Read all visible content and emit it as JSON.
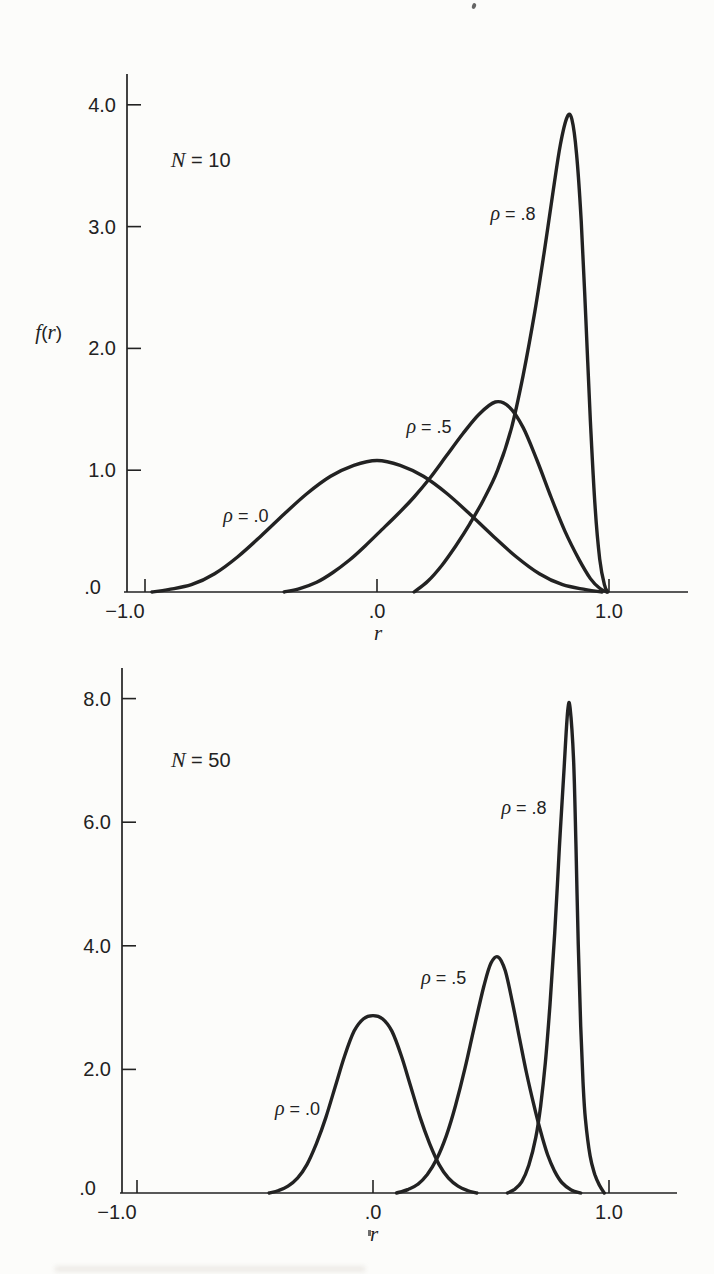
{
  "figure": {
    "background": "#fcfcfa",
    "ink": "#222222",
    "description_visible_text_only": true
  },
  "chart_data": [
    {
      "id": "n10",
      "type": "line",
      "title": "N = 10",
      "xlabel": "r",
      "ylabel": "f(r)",
      "xlim": [
        -1.09,
        1.34
      ],
      "ylim": [
        0,
        4.25
      ],
      "grid": false,
      "legend": "inline-curve-labels",
      "x_ticks": [
        {
          "value": -1.0,
          "label": "−1.0"
        },
        {
          "value": 0.0,
          "label": ".0"
        },
        {
          "value": 1.0,
          "label": "1.0"
        }
      ],
      "y_ticks": [
        {
          "value": 4.0,
          "label": "4.0"
        },
        {
          "value": 3.0,
          "label": "3.0"
        },
        {
          "value": 2.0,
          "label": "2.0"
        },
        {
          "value": 1.0,
          "label": "1.0"
        },
        {
          "value": 0.0,
          "label": ".0"
        }
      ],
      "annotations": [
        {
          "name": "sample-size-label",
          "text": "N = 10",
          "at": {
            "x": -0.76,
            "y": 3.55
          }
        }
      ],
      "series": [
        {
          "name": "rho-0.0",
          "rho": 0.0,
          "label": "ρ = .0",
          "label_at": {
            "x": -0.565,
            "y": 0.63
          },
          "points": [
            [
              -0.97,
              0
            ],
            [
              -0.9,
              0.02
            ],
            [
              -0.8,
              0.06
            ],
            [
              -0.7,
              0.15
            ],
            [
              -0.6,
              0.29
            ],
            [
              -0.5,
              0.46
            ],
            [
              -0.4,
              0.64
            ],
            [
              -0.3,
              0.81
            ],
            [
              -0.2,
              0.95
            ],
            [
              -0.1,
              1.04
            ],
            [
              0,
              1.08
            ],
            [
              0.1,
              1.04
            ],
            [
              0.2,
              0.95
            ],
            [
              0.3,
              0.81
            ],
            [
              0.4,
              0.64
            ],
            [
              0.5,
              0.46
            ],
            [
              0.6,
              0.29
            ],
            [
              0.7,
              0.15
            ],
            [
              0.8,
              0.06
            ],
            [
              0.9,
              0.02
            ],
            [
              0.97,
              0
            ]
          ]
        },
        {
          "name": "rho-0.5",
          "rho": 0.5,
          "label": "ρ = .5",
          "label_at": {
            "x": 0.224,
            "y": 1.36
          },
          "points": [
            [
              -0.4,
              0
            ],
            [
              -0.33,
              0.03
            ],
            [
              -0.26,
              0.08
            ],
            [
              -0.19,
              0.16
            ],
            [
              -0.12,
              0.26
            ],
            [
              -0.05,
              0.38
            ],
            [
              0.02,
              0.51
            ],
            [
              0.09,
              0.64
            ],
            [
              0.16,
              0.78
            ],
            [
              0.23,
              0.94
            ],
            [
              0.3,
              1.12
            ],
            [
              0.37,
              1.3
            ],
            [
              0.44,
              1.46
            ],
            [
              0.51,
              1.56
            ],
            [
              0.57,
              1.52
            ],
            [
              0.63,
              1.35
            ],
            [
              0.69,
              1.08
            ],
            [
              0.75,
              0.78
            ],
            [
              0.81,
              0.5
            ],
            [
              0.87,
              0.27
            ],
            [
              0.92,
              0.11
            ],
            [
              0.96,
              0.03
            ],
            [
              0.99,
              0
            ]
          ]
        },
        {
          "name": "rho-0.8",
          "rho": 0.8,
          "label": "ρ = .8",
          "label_at": {
            "x": 0.586,
            "y": 3.11
          },
          "points": [
            [
              0.16,
              0
            ],
            [
              0.22,
              0.09
            ],
            [
              0.28,
              0.22
            ],
            [
              0.34,
              0.38
            ],
            [
              0.4,
              0.56
            ],
            [
              0.46,
              0.76
            ],
            [
              0.52,
              1.0
            ],
            [
              0.58,
              1.35
            ],
            [
              0.63,
              1.78
            ],
            [
              0.68,
              2.3
            ],
            [
              0.72,
              2.78
            ],
            [
              0.76,
              3.3
            ],
            [
              0.79,
              3.67
            ],
            [
              0.82,
              3.9
            ],
            [
              0.84,
              3.88
            ],
            [
              0.86,
              3.6
            ],
            [
              0.88,
              3.05
            ],
            [
              0.9,
              2.25
            ],
            [
              0.92,
              1.4
            ],
            [
              0.94,
              0.7
            ],
            [
              0.96,
              0.27
            ],
            [
              0.98,
              0.06
            ],
            [
              0.995,
              0
            ]
          ]
        }
      ]
    },
    {
      "id": "n50",
      "type": "line",
      "title": "N = 50",
      "xlabel": "r",
      "ylabel": "",
      "xlim": [
        -1.07,
        1.29
      ],
      "ylim": [
        0,
        8.5
      ],
      "grid": false,
      "legend": "inline-curve-labels",
      "x_ticks": [
        {
          "value": -1.0,
          "label": "−1.0"
        },
        {
          "value": 0.0,
          "label": ".0"
        },
        {
          "value": 1.0,
          "label": "1.0"
        }
      ],
      "y_ticks": [
        {
          "value": 8.0,
          "label": "8.0"
        },
        {
          "value": 6.0,
          "label": "6.0"
        },
        {
          "value": 4.0,
          "label": "4.0"
        },
        {
          "value": 2.0,
          "label": "2.0"
        },
        {
          "value": 0.0,
          "label": ".0"
        }
      ],
      "annotations": [
        {
          "name": "sample-size-label",
          "text": "N = 50",
          "at": {
            "x": -0.73,
            "y": 7.0
          }
        }
      ],
      "series": [
        {
          "name": "rho-0.0",
          "rho": 0.0,
          "label": "ρ = .0",
          "label_at": {
            "x": -0.32,
            "y": 1.38
          },
          "points": [
            [
              -0.44,
              0
            ],
            [
              -0.4,
              0.04
            ],
            [
              -0.36,
              0.11
            ],
            [
              -0.32,
              0.24
            ],
            [
              -0.28,
              0.46
            ],
            [
              -0.24,
              0.8
            ],
            [
              -0.2,
              1.22
            ],
            [
              -0.16,
              1.72
            ],
            [
              -0.12,
              2.22
            ],
            [
              -0.08,
              2.62
            ],
            [
              -0.04,
              2.82
            ],
            [
              0,
              2.87
            ],
            [
              0.04,
              2.82
            ],
            [
              0.08,
              2.62
            ],
            [
              0.12,
              2.22
            ],
            [
              0.16,
              1.72
            ],
            [
              0.2,
              1.22
            ],
            [
              0.24,
              0.8
            ],
            [
              0.28,
              0.46
            ],
            [
              0.32,
              0.24
            ],
            [
              0.36,
              0.11
            ],
            [
              0.4,
              0.04
            ],
            [
              0.44,
              0
            ]
          ]
        },
        {
          "name": "rho-0.5",
          "rho": 0.5,
          "label": "ρ = .5",
          "label_at": {
            "x": 0.3,
            "y": 3.5
          },
          "points": [
            [
              0.1,
              0
            ],
            [
              0.15,
              0.06
            ],
            [
              0.19,
              0.14
            ],
            [
              0.23,
              0.3
            ],
            [
              0.27,
              0.55
            ],
            [
              0.31,
              0.92
            ],
            [
              0.35,
              1.42
            ],
            [
              0.39,
              2.02
            ],
            [
              0.43,
              2.7
            ],
            [
              0.47,
              3.35
            ],
            [
              0.5,
              3.72
            ],
            [
              0.53,
              3.82
            ],
            [
              0.56,
              3.6
            ],
            [
              0.59,
              3.1
            ],
            [
              0.62,
              2.52
            ],
            [
              0.65,
              1.95
            ],
            [
              0.68,
              1.45
            ],
            [
              0.71,
              1.0
            ],
            [
              0.74,
              0.62
            ],
            [
              0.77,
              0.35
            ],
            [
              0.8,
              0.17
            ],
            [
              0.84,
              0.05
            ],
            [
              0.88,
              0
            ]
          ]
        },
        {
          "name": "rho-0.8",
          "rho": 0.8,
          "label": "ρ = .8",
          "label_at": {
            "x": 0.64,
            "y": 6.25
          },
          "points": [
            [
              0.57,
              0
            ],
            [
              0.6,
              0.06
            ],
            [
              0.63,
              0.18
            ],
            [
              0.66,
              0.45
            ],
            [
              0.69,
              0.9
            ],
            [
              0.71,
              1.4
            ],
            [
              0.73,
              2.1
            ],
            [
              0.75,
              3.05
            ],
            [
              0.77,
              4.2
            ],
            [
              0.79,
              5.6
            ],
            [
              0.81,
              6.9
            ],
            [
              0.825,
              7.8
            ],
            [
              0.835,
              7.85
            ],
            [
              0.85,
              7.0
            ],
            [
              0.86,
              5.6
            ],
            [
              0.87,
              4.0
            ],
            [
              0.88,
              2.7
            ],
            [
              0.89,
              1.8
            ],
            [
              0.9,
              1.2
            ],
            [
              0.92,
              0.6
            ],
            [
              0.94,
              0.3
            ],
            [
              0.96,
              0.12
            ],
            [
              0.98,
              0
            ]
          ]
        }
      ]
    }
  ]
}
